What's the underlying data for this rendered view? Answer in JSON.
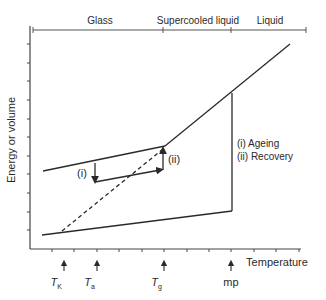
{
  "diagram": {
    "y_axis_label": "Energy or volume",
    "x_axis_label": "Temperature",
    "regions": [
      {
        "label": "Glass"
      },
      {
        "label": "Supercooled liquid"
      },
      {
        "label": "Liquid"
      }
    ],
    "annotations": {
      "step_i": "(i)",
      "step_ii": "(ii)",
      "legend_line1": "(i) Ageing",
      "legend_line2": "(ii) Recovery"
    },
    "temperature_markers": [
      {
        "symbol": "T",
        "subscript": "K"
      },
      {
        "symbol": "T",
        "subscript": "a"
      },
      {
        "symbol": "T",
        "subscript": "g"
      },
      {
        "symbol": "mp",
        "subscript": ""
      }
    ],
    "colors": {
      "line": "#2a2a2a",
      "axis": "#444444",
      "background": "#ffffff"
    }
  }
}
